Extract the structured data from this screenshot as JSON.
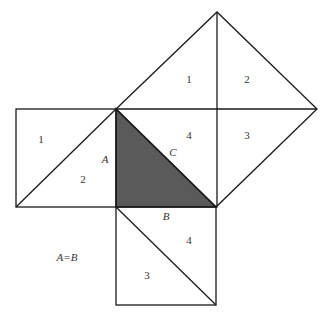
{
  "diagram": {
    "type": "pythagorean-dissection-proof",
    "colors": {
      "stroke": "#1a1a1a",
      "shaded_triangle": "#5a5a5a",
      "background": "#ffffff",
      "label": "#333333"
    },
    "labels": {
      "left_square_1": "1",
      "left_square_2": "2",
      "side_a": "A",
      "hyp_square_1": "1",
      "hyp_square_2": "2",
      "hyp_square_3": "3",
      "hyp_square_4": "4",
      "side_c": "C",
      "side_b": "B",
      "bottom_square_4": "4",
      "bottom_square_3": "3",
      "equation": "A=B"
    }
  }
}
